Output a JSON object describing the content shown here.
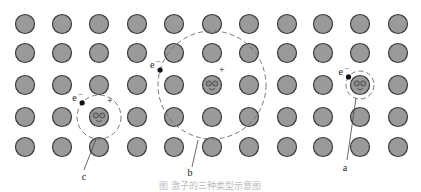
{
  "figure": {
    "grid": {
      "rows": 5,
      "cols": 11
    },
    "orbits": [
      {
        "id": "c",
        "label": "c",
        "electron_label": "e",
        "electron_charge": "−",
        "hole_label": "+",
        "center_col": 2,
        "center_row": 3,
        "size": "small-medium"
      },
      {
        "id": "b",
        "label": "b",
        "electron_label": "e",
        "electron_charge": "−",
        "hole_label": "+",
        "center_col": 5,
        "center_row": 2,
        "size": "large"
      },
      {
        "id": "a",
        "label": "a",
        "electron_label": "e",
        "electron_charge": "−",
        "hole_label": "",
        "center_col": 9,
        "center_row": 2,
        "size": "small"
      }
    ],
    "caption": "图  激子的三种类型示意图"
  },
  "colors": {
    "atom_fill": "#9a9a9a",
    "atom_stroke": "#3a3a3a",
    "orbit": "#6a6a6a",
    "electron": "#111111"
  }
}
